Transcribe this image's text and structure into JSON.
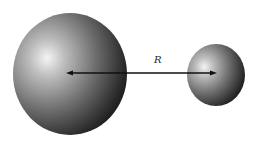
{
  "diagram": {
    "distance_label": "R",
    "spheres": [
      {
        "name": "large",
        "cx": 70,
        "cy": 74,
        "rx": 57,
        "ry": 61
      },
      {
        "name": "small",
        "cx": 216,
        "cy": 75,
        "rx": 29,
        "ry": 31
      }
    ],
    "arrow": {
      "x1": 68,
      "x2": 215,
      "y": 73,
      "double_headed": true
    },
    "colors": {
      "arrow": "#111111",
      "background": "#ffffff"
    }
  }
}
